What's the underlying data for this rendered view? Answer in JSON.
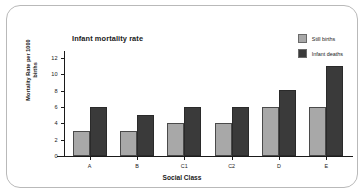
{
  "chart_data": {
    "type": "bar",
    "title": "Infant mortality rate",
    "xlabel": "Social Class",
    "ylabel": "Mortality Rate per 1000 births",
    "categories": [
      "A",
      "B",
      "C1",
      "C2",
      "D",
      "E"
    ],
    "series": [
      {
        "name": "Still births",
        "color": "#a8a8a8",
        "values": [
          3,
          3,
          4,
          4,
          6,
          6
        ]
      },
      {
        "name": "Infant deaths",
        "color": "#3a3a3a",
        "values": [
          6,
          5,
          6,
          6,
          8,
          11
        ]
      }
    ],
    "ylim": [
      0,
      13
    ],
    "yticks": [
      0,
      2,
      4,
      6,
      8,
      10,
      12
    ],
    "grid": false,
    "legend_position": "top-right"
  }
}
